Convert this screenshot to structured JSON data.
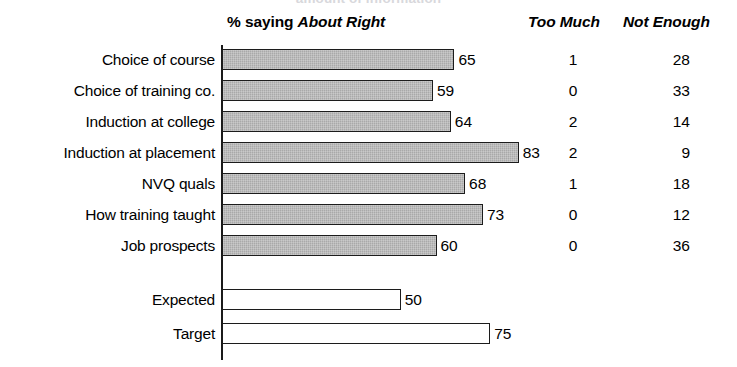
{
  "title": "amount of information",
  "header": {
    "main_prefix": "% saying ",
    "main_emph": "About Right",
    "too_much": "Too Much",
    "not_enough": "Not Enough"
  },
  "chart_data": {
    "type": "bar",
    "title": "amount of information",
    "xlabel": "",
    "ylabel": "",
    "xlim": [
      0,
      100
    ],
    "grid": false,
    "orientation": "horizontal",
    "categories": [
      "Choice of course",
      "Choice of training co.",
      "Induction at college",
      "Induction at placement",
      "NVQ quals",
      "How training taught",
      "Job prospects",
      "Expected",
      "Target"
    ],
    "series": [
      {
        "name": "% saying About Right",
        "values": [
          65,
          59,
          64,
          83,
          68,
          73,
          60,
          50,
          75
        ]
      },
      {
        "name": "Too Much",
        "values": [
          1,
          0,
          2,
          2,
          1,
          0,
          0,
          null,
          null
        ]
      },
      {
        "name": "Not Enough",
        "values": [
          28,
          33,
          14,
          9,
          18,
          12,
          36,
          null,
          null
        ]
      }
    ]
  },
  "rows": [
    {
      "label": "Choice of course",
      "value": 65,
      "too_much": "1",
      "not_enough": "28",
      "style": "filled"
    },
    {
      "label": "Choice of training co.",
      "value": 59,
      "too_much": "0",
      "not_enough": "33",
      "style": "filled"
    },
    {
      "label": "Induction at college",
      "value": 64,
      "too_much": "2",
      "not_enough": "14",
      "style": "filled"
    },
    {
      "label": "Induction at placement",
      "value": 83,
      "too_much": "2",
      "not_enough": "9",
      "style": "filled"
    },
    {
      "label": "NVQ quals",
      "value": 68,
      "too_much": "1",
      "not_enough": "18",
      "style": "filled"
    },
    {
      "label": "How training taught",
      "value": 73,
      "too_much": "0",
      "not_enough": "12",
      "style": "filled"
    },
    {
      "label": "Job prospects",
      "value": 60,
      "too_much": "0",
      "not_enough": "36",
      "style": "filled"
    },
    {
      "label": "Expected",
      "value": 50,
      "too_much": "",
      "not_enough": "",
      "style": "hollow"
    },
    {
      "label": "Target",
      "value": 75,
      "too_much": "",
      "not_enough": "",
      "style": "hollow"
    }
  ],
  "geometry": {
    "axis_x": 222,
    "px_per_unit": 3.575,
    "row_tops": [
      48,
      79,
      110,
      141,
      172,
      203,
      234,
      288,
      322
    ]
  },
  "colors": {
    "bar_fill": "#a9a9a9",
    "bar_stroke": "#1c1c1c",
    "text": "#000000",
    "background": "#ffffff"
  }
}
